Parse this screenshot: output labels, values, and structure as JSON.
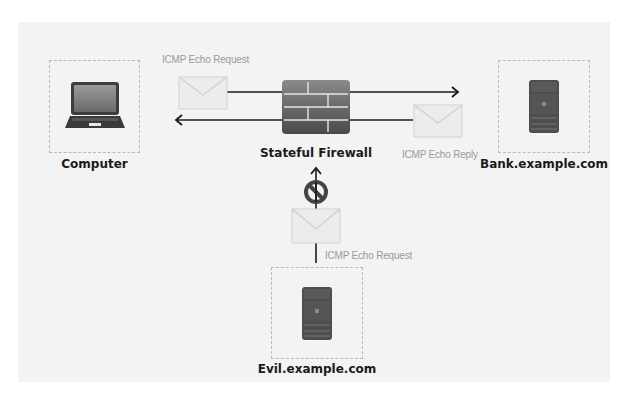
{
  "diagram": {
    "nodes": {
      "computer": {
        "label": "Computer",
        "icon": "laptop-icon"
      },
      "firewall": {
        "label": "Stateful Firewall",
        "icon": "firewall-brick-icon"
      },
      "bank": {
        "label": "Bank.example.com",
        "icon": "server-icon"
      },
      "evil": {
        "label": "Evil.example.com",
        "icon": "server-icon"
      }
    },
    "messages": {
      "request_out": {
        "label": "ICMP Echo Request",
        "icon": "envelope-icon",
        "direction": "Computer → Firewall → Bank.example.com"
      },
      "reply_in": {
        "label": "ICMP Echo Reply",
        "icon": "envelope-icon",
        "direction": "Bank.example.com → Firewall → Computer"
      },
      "evil_request": {
        "label": "ICMP Echo Request",
        "icon": "envelope-icon",
        "direction": "Evil.example.com → Firewall (blocked)",
        "blocked_icon": "prohibited-icon"
      }
    },
    "colors": {
      "panel_bg": "#f3f3f3",
      "arrow": "#1a1a1a",
      "envelope_fill": "#ececec",
      "device_dark": "#4a4a4a",
      "label_gray": "#9a9a9a"
    }
  }
}
